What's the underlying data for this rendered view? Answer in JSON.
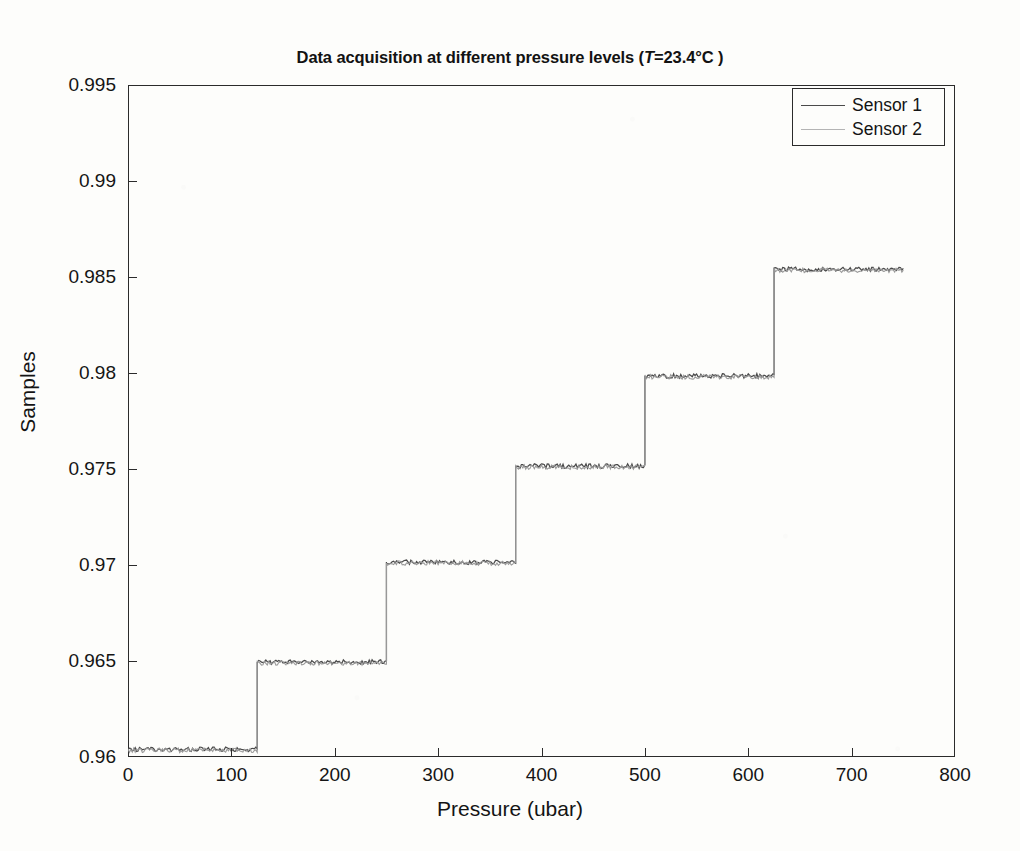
{
  "figure": {
    "title_prefix": "Data acquisition at different pressure levels (",
    "title_var": "T",
    "title_suffix": "=23.4°C )",
    "title_full": "Data acquisition at different pressure levels (T=23.4°C )",
    "background_color": "#fdfdfb",
    "axis_color": "#2b2b2b"
  },
  "chart_data": {
    "type": "line",
    "title": "Data acquisition at different pressure levels (T=23.4°C )",
    "xlabel": "Pressure (ubar)",
    "ylabel": "Samples",
    "xlim": [
      0,
      800
    ],
    "ylim": [
      0.96,
      0.995
    ],
    "xticks": [
      0,
      100,
      200,
      300,
      400,
      500,
      600,
      700,
      800
    ],
    "xtick_labels": [
      "0",
      "100",
      "200",
      "300",
      "400",
      "500",
      "600",
      "700",
      "800"
    ],
    "yticks": [
      0.96,
      0.965,
      0.97,
      0.975,
      0.98,
      0.985,
      0.99,
      0.995
    ],
    "ytick_labels": [
      "0.96",
      "0.965",
      "0.97",
      "0.975",
      "0.98",
      "0.985",
      "0.99",
      "0.995"
    ],
    "grid": false,
    "legend_position": "upper right",
    "step_edges": [
      0,
      125,
      250,
      375,
      500,
      625,
      750
    ],
    "step_levels": [
      0.9604,
      0.96495,
      0.97015,
      0.97515,
      0.97985,
      0.9854
    ],
    "noise_amplitude": 0.00012,
    "series": [
      {
        "name": "Sensor 1",
        "color": "#4a4a4a",
        "values": [
          0.9604,
          0.96495,
          0.97015,
          0.97515,
          0.97985,
          0.9854
        ]
      },
      {
        "name": "Sensor 2",
        "color": "#9a9a9a",
        "values": [
          0.96035,
          0.9649,
          0.9701,
          0.9751,
          0.9798,
          0.98535
        ]
      }
    ]
  },
  "legend": {
    "entries": [
      {
        "label": "Sensor 1",
        "color": "#4a4a4a"
      },
      {
        "label": "Sensor 2",
        "color": "#9a9a9a"
      }
    ]
  }
}
